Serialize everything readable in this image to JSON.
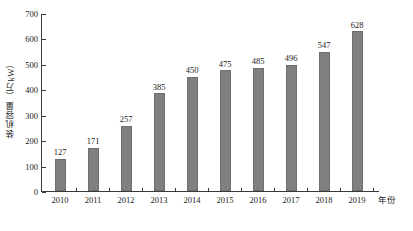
{
  "chart_data": {
    "type": "bar",
    "title": "",
    "xlabel": "年份",
    "ylabel": "装机容量（万kW）",
    "categories": [
      "2010",
      "2011",
      "2012",
      "2013",
      "2014",
      "2015",
      "2016",
      "2017",
      "2018",
      "2019"
    ],
    "values": [
      127,
      171,
      257,
      385,
      450,
      475,
      485,
      496,
      547,
      628
    ],
    "value_labels": [
      "127",
      "171",
      "257",
      "385",
      "450",
      "475",
      "485",
      "496",
      "547",
      "628"
    ],
    "ylim": [
      0,
      700
    ],
    "ytick_values": [
      0,
      100,
      200,
      300,
      400,
      500,
      600,
      700
    ],
    "ytick_labels": [
      "0",
      "100",
      "200",
      "300",
      "400",
      "500",
      "600",
      "700"
    ],
    "grid": false,
    "legend": null,
    "series_color": "#808080",
    "axis_color": "#3a3a3a",
    "background": "#ffffff"
  }
}
